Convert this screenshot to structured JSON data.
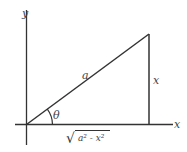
{
  "diagram": {
    "type": "right-triangle",
    "axes": {
      "x_label": "x",
      "y_label": "y"
    },
    "hypotenuse_label": "a",
    "opposite_label": "x",
    "angle_label": "θ",
    "adjacent_label": {
      "radical": "√",
      "radicand": "a² - x²"
    },
    "colors": {
      "stroke": "#333333",
      "text": "#444444",
      "background": "#ffffff"
    }
  }
}
